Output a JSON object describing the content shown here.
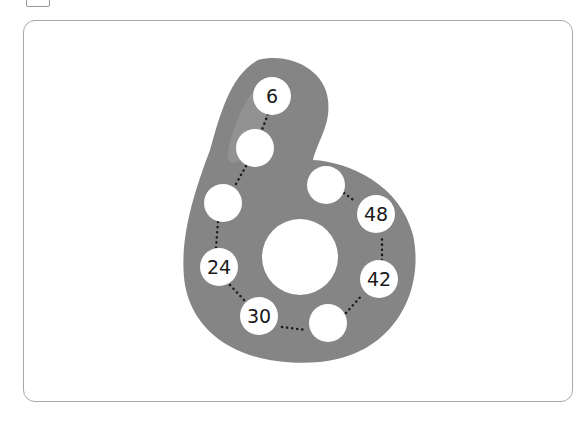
{
  "figure": {
    "shape": "digit-6",
    "shape_color": "#858585",
    "highlight_color": "#9a9a9a",
    "dot_color": "#1a1a1a"
  },
  "circles": [
    {
      "label": "6"
    },
    {
      "label": ""
    },
    {
      "label": ""
    },
    {
      "label": "24"
    },
    {
      "label": "30"
    },
    {
      "label": ""
    },
    {
      "label": "42"
    },
    {
      "label": "48"
    },
    {
      "label": ""
    }
  ]
}
